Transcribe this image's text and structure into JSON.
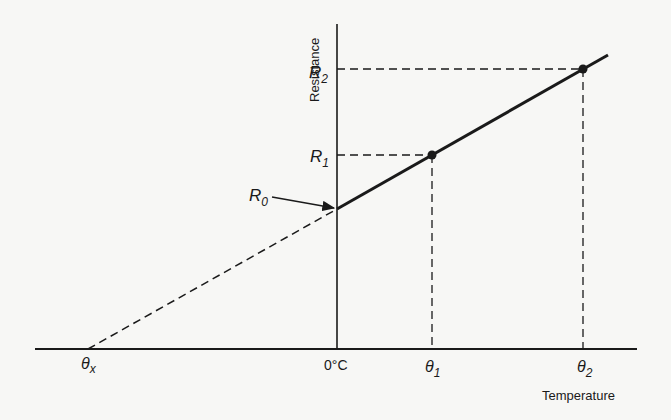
{
  "diagram": {
    "type": "line",
    "axes": {
      "x_label": "Temperature",
      "y_label": "Resistance",
      "origin_label": "0°C"
    },
    "x_ticks": [
      {
        "sym": "θ",
        "sub": "x"
      },
      {
        "sym": "θ",
        "sub": "1"
      },
      {
        "sym": "θ",
        "sub": "2"
      }
    ],
    "y_ticks": [
      {
        "sym": "R",
        "sub": "0"
      },
      {
        "sym": "R",
        "sub": "1"
      },
      {
        "sym": "R",
        "sub": "2"
      }
    ],
    "points": [
      {
        "name": "R0",
        "label": "(0°C, R0)"
      },
      {
        "name": "P1",
        "label": "(θ1, R1)"
      },
      {
        "name": "P2",
        "label": "(θ2, R2)"
      }
    ],
    "colors": {
      "ink": "#1a1a1a",
      "background": "#f7f7f5"
    }
  }
}
